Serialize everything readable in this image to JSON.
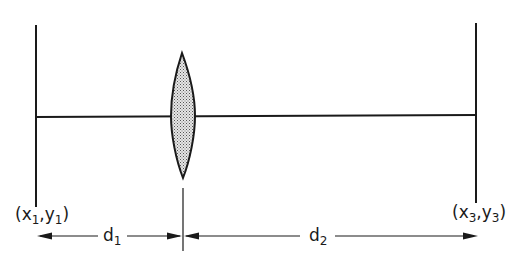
{
  "diagram": {
    "type": "optical-system",
    "colors": {
      "line": "#1a1a1a",
      "lens_fill": "#c8c8c8",
      "background": "#ffffff"
    },
    "input_plane": {
      "label": "(x1,y1)",
      "var_x": "x",
      "sub_x": "1",
      "var_y": "y",
      "sub_y": "1"
    },
    "output_plane": {
      "label": "(x3,y3)",
      "var_x": "x",
      "sub_x": "3",
      "var_y": "y",
      "sub_y": "3"
    },
    "lens": {
      "label": "lens"
    },
    "distances": [
      {
        "label": "d1",
        "var": "d",
        "sub": "1"
      },
      {
        "label": "d2",
        "var": "d",
        "sub": "2"
      }
    ],
    "punct": {
      "open": "(",
      "comma": ",",
      "close": ")"
    }
  }
}
